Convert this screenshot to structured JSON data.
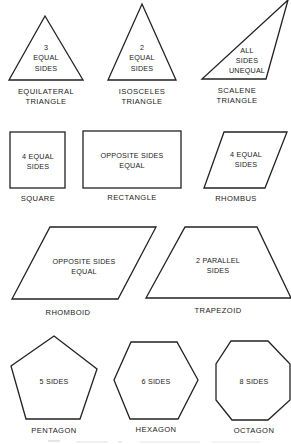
{
  "figure": {
    "shapes": [
      {
        "id": "equilateral-triangle",
        "group": "triangles",
        "inner_text": [
          "3",
          "EQUAL",
          "SIDES"
        ],
        "label": [
          "EQUILATERAL",
          "TRIANGLE"
        ]
      },
      {
        "id": "isosceles-triangle",
        "group": "triangles",
        "inner_text": [
          "2",
          "EQUAL",
          "SIDES"
        ],
        "label": [
          "ISOSCELES",
          "TRIANGLE"
        ]
      },
      {
        "id": "scalene-triangle",
        "group": "triangles",
        "inner_text": [
          "ALL",
          "SIDES",
          "UNEQUAL"
        ],
        "label": [
          "SCALENE",
          "TRIANGLE"
        ]
      },
      {
        "id": "square",
        "group": "quadrilaterals",
        "inner_text": [
          "4 EQUAL",
          "SIDES"
        ],
        "label": [
          "SQUARE"
        ]
      },
      {
        "id": "rectangle",
        "group": "quadrilaterals",
        "inner_text": [
          "OPPOSITE SIDES",
          "EQUAL"
        ],
        "label": [
          "RECTANGLE"
        ]
      },
      {
        "id": "rhombus",
        "group": "quadrilaterals",
        "inner_text": [
          "4 EQUAL",
          "SIDES"
        ],
        "label": [
          "RHOMBUS"
        ]
      },
      {
        "id": "rhomboid",
        "group": "quadrilaterals",
        "inner_text": [
          "OPPOSITE SIDES",
          "EQUAL"
        ],
        "label": [
          "RHOMBOID"
        ]
      },
      {
        "id": "trapezoid",
        "group": "quadrilaterals",
        "inner_text": [
          "2 PARALLEL",
          "SIDES"
        ],
        "label": [
          "TRAPEZOID"
        ]
      },
      {
        "id": "pentagon",
        "group": "polygons",
        "inner_text": [
          "5 SIDES"
        ],
        "label": [
          "PENTAGON"
        ]
      },
      {
        "id": "hexagon",
        "group": "polygons",
        "inner_text": [
          "6 SIDES"
        ],
        "label": [
          "HEXAGON"
        ]
      },
      {
        "id": "octagon",
        "group": "polygons",
        "inner_text": [
          "8 SIDES"
        ],
        "label": [
          "OCTAGON"
        ]
      }
    ]
  },
  "colors": {
    "stroke": "#222222",
    "text": "#222222",
    "background": "#ffffff"
  }
}
